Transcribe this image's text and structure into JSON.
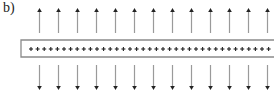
{
  "diagram": {
    "label": "b)",
    "plate": {
      "charge_symbol": "+",
      "charge_count": 37,
      "left": 21,
      "top": 40,
      "bottom": 57,
      "plus_start_x": 31,
      "plus_spacing": 6.6
    },
    "arrows": {
      "count": 13,
      "start_x": 39,
      "spacing": 19.0,
      "up": {
        "direction": "up",
        "tip_y": 8,
        "tail_y": 33
      },
      "down": {
        "direction": "down",
        "tail_y": 65,
        "tip_y": 90
      }
    },
    "colors": {
      "plate_border": "#8a8a8a",
      "plus": "#222222",
      "arrow_shaft": "#9a9a9a",
      "arrow_head": "#222222"
    }
  }
}
